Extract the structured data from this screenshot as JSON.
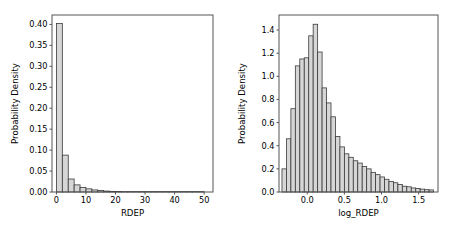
{
  "figure": {
    "background_color": "#ffffff",
    "bar_fill_color": "#d6d6d6",
    "bar_edge_color": "#3a3a3a",
    "axis_color": "#555555"
  },
  "chart_data": [
    {
      "panel": "left",
      "type": "bar",
      "title": "",
      "xlabel": "RDEP",
      "ylabel": "Probability Density",
      "xlim": [
        -1.5,
        53.0
      ],
      "ylim": [
        0.0,
        0.4225
      ],
      "xticks": [
        0,
        10,
        20,
        30,
        40,
        50
      ],
      "xtick_labels": [
        "0",
        "10",
        "20",
        "30",
        "40",
        "50"
      ],
      "yticks": [
        0.0,
        0.05,
        0.1,
        0.15,
        0.2,
        0.25,
        0.3,
        0.35,
        0.4
      ],
      "ytick_labels": [
        "0.00",
        "0.05",
        "0.10",
        "0.15",
        "0.20",
        "0.25",
        "0.30",
        "0.35",
        "0.40"
      ],
      "grid": false,
      "legend": false,
      "bin_edges": [
        0,
        2,
        4,
        6,
        8,
        10,
        12,
        14,
        16,
        18,
        20,
        22,
        24,
        26,
        28,
        30,
        32,
        34,
        36,
        38,
        40,
        42,
        44,
        46,
        48,
        50
      ],
      "values": [
        0.402,
        0.088,
        0.031,
        0.017,
        0.011,
        0.0075,
        0.005,
        0.0035,
        0.0022,
        0.0015,
        0.0011,
        0.0008,
        0.0006,
        0.0005,
        0.0004,
        0.0003,
        0.0003,
        0.0002,
        0.0002,
        0.0002,
        0.0001,
        0.0001,
        0.0001,
        0.0001,
        0.0001
      ]
    },
    {
      "panel": "right",
      "type": "bar",
      "title": "",
      "xlabel": "log_RDEP",
      "ylabel": "Probability Density",
      "xlim": [
        -0.38,
        1.76
      ],
      "ylim": [
        0.0,
        1.53
      ],
      "xticks": [
        0.0,
        0.5,
        1.0,
        1.5
      ],
      "xtick_labels": [
        "0.0",
        "0.5",
        "1.0",
        "1.5"
      ],
      "yticks": [
        0.0,
        0.2,
        0.4,
        0.6,
        0.8,
        1.0,
        1.2,
        1.4
      ],
      "ytick_labels": [
        "0.0",
        "0.2",
        "0.4",
        "0.6",
        "0.8",
        "1.0",
        "1.2",
        "1.4"
      ],
      "grid": false,
      "legend": false,
      "bin_edges": [
        -0.34,
        -0.28,
        -0.22,
        -0.16,
        -0.1,
        -0.04,
        0.02,
        0.08,
        0.14,
        0.2,
        0.26,
        0.32,
        0.38,
        0.44,
        0.5,
        0.56,
        0.62,
        0.68,
        0.74,
        0.8,
        0.86,
        0.92,
        0.98,
        1.04,
        1.1,
        1.16,
        1.22,
        1.28,
        1.34,
        1.4,
        1.46,
        1.52,
        1.58,
        1.64,
        1.7
      ],
      "values": [
        0.2,
        0.46,
        0.72,
        1.09,
        1.15,
        1.16,
        1.35,
        1.45,
        1.21,
        0.9,
        0.77,
        0.65,
        0.48,
        0.39,
        0.33,
        0.3,
        0.27,
        0.25,
        0.22,
        0.2,
        0.17,
        0.15,
        0.13,
        0.11,
        0.09,
        0.08,
        0.065,
        0.05,
        0.045,
        0.035,
        0.03,
        0.025,
        0.02,
        0.018
      ]
    }
  ]
}
